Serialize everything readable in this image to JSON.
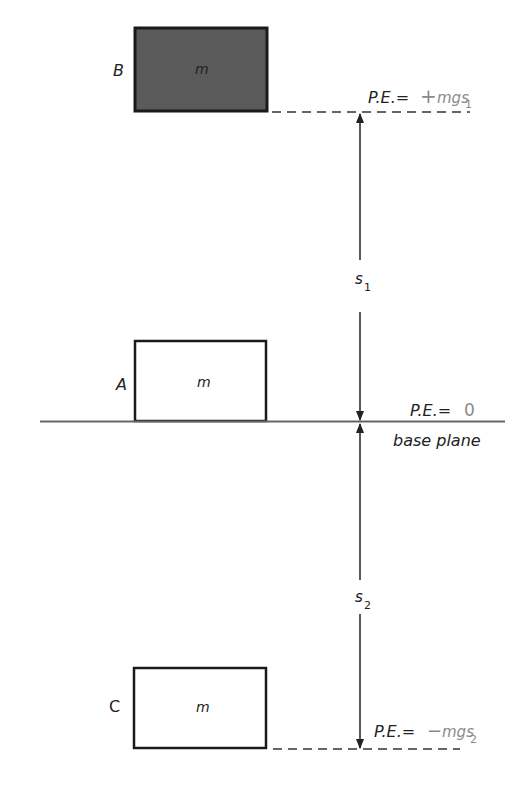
{
  "diagram": {
    "blocks": [
      {
        "id": "B",
        "label": "B",
        "mass": "m",
        "filled": true
      },
      {
        "id": "A",
        "label": "A",
        "mass": "m",
        "filled": false
      },
      {
        "id": "C",
        "label": "C",
        "mass": "m",
        "filled": false
      }
    ],
    "levels": {
      "top": {
        "pe_prefix": "P.E.=",
        "pe_sign": "+",
        "pe_value": "mgs",
        "pe_sub": "1"
      },
      "base": {
        "pe_prefix": "P.E.=",
        "pe_value": "0",
        "caption": "base plane"
      },
      "bottom": {
        "pe_prefix": "P.E.=",
        "pe_sign": "−",
        "pe_value": "mgs",
        "pe_sub": "2"
      }
    },
    "distances": [
      {
        "name": "s",
        "sub": "1"
      },
      {
        "name": "s",
        "sub": "2"
      }
    ],
    "colors": {
      "block_fill": "#5a5a5a",
      "line": "#222222",
      "pe_value": "#8a8a8a"
    }
  }
}
